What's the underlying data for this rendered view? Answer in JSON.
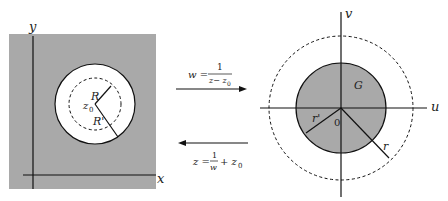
{
  "left_panel": {
    "x_axis_label": "x",
    "y_axis_label": "y",
    "center_label": "z",
    "center_subscript": "0",
    "inner_radius_label": "R",
    "outer_radius_label": "R'",
    "fill_color": "#a9a9a9",
    "disk_color": "#ffffff"
  },
  "forward_map": {
    "lhs": "w =",
    "numerator": "1",
    "denominator": "z− z",
    "denominator_subscript": "0"
  },
  "inverse_map": {
    "lhs": "z =",
    "numerator": "1",
    "denominator": "w",
    "tail": "+ z",
    "tail_subscript": "0"
  },
  "right_panel": {
    "u_axis_label": "u",
    "v_axis_label": "v",
    "region_label": "G",
    "origin_label": "0",
    "inner_radius_label": "r'",
    "outer_radius_label": "r",
    "fill_color": "#a9a9a9"
  }
}
